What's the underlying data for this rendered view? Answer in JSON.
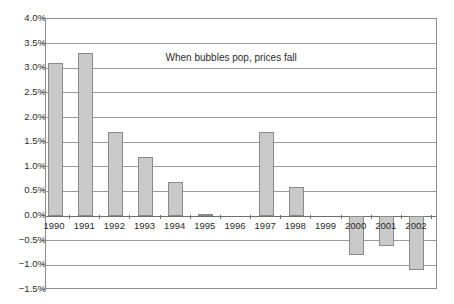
{
  "chart_data": {
    "type": "bar",
    "title": "",
    "annotations": [
      {
        "text": "When bubbles pop, prices fall",
        "x": "1993",
        "y": 3.2
      }
    ],
    "categories": [
      "1990",
      "1991",
      "1992",
      "1993",
      "1994",
      "1995",
      "1996",
      "1997",
      "1998",
      "1999",
      "2000",
      "2001",
      "2002"
    ],
    "values": [
      3.1,
      3.3,
      1.7,
      1.2,
      0.7,
      0.05,
      0.0,
      1.7,
      0.6,
      0.0,
      -0.8,
      -0.6,
      -1.1
    ],
    "series": [
      {
        "name": "",
        "values": [
          3.1,
          3.3,
          1.7,
          1.2,
          0.7,
          0.05,
          0.0,
          1.7,
          0.6,
          0.0,
          -0.8,
          -0.6,
          -1.1
        ]
      }
    ],
    "xlabel": "",
    "ylabel": "",
    "ylim": [
      -1.5,
      4.0
    ],
    "ytick_step": 0.5,
    "ytick_labels": [
      "4.0%",
      "3.5%",
      "3.0%",
      "2.5%",
      "2.0%",
      "1.5%",
      "1.0%",
      "0.5%",
      "0.0%",
      "−0.5%",
      "−1.0%",
      "−1.5%"
    ],
    "ytick_values": [
      4.0,
      3.5,
      3.0,
      2.5,
      2.0,
      1.5,
      1.0,
      0.5,
      0.0,
      -0.5,
      -1.0,
      -1.5
    ],
    "grid": true,
    "legend": "none",
    "value_format": "percent",
    "colors": {
      "bar_fill": "#c9c9c9",
      "bar_border": "#8a8a8a",
      "gridline": "#9a9a9a",
      "zero_line": "#6e6e6e",
      "frame": "#8d8d8d",
      "text": "#2b2b2b",
      "background": "#ffffff"
    }
  }
}
